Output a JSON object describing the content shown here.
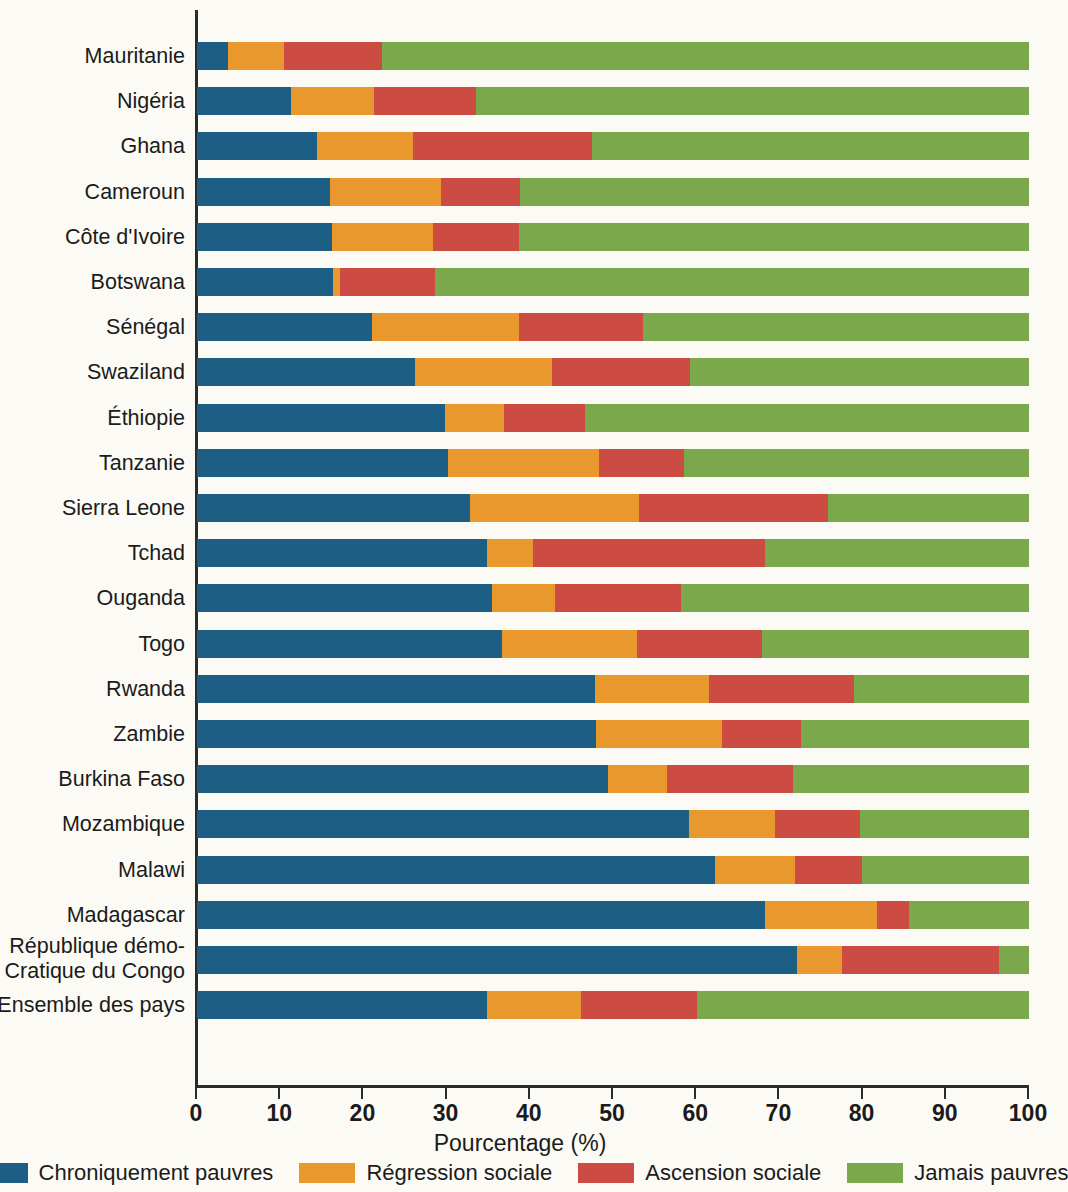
{
  "chart_data": {
    "type": "bar",
    "orientation": "horizontal",
    "stacked": true,
    "stacked_mode": "percent",
    "title": "",
    "xlabel": "Pourcentage (%)",
    "ylabel": "",
    "xlim": [
      0,
      100
    ],
    "xticks": [
      0,
      10,
      20,
      30,
      40,
      50,
      60,
      70,
      80,
      90,
      100
    ],
    "grid": false,
    "legend_position": "bottom",
    "colors": {
      "chroniquement_pauvres": "#1d5f84",
      "regression_sociale": "#e8982c",
      "ascension_sociale": "#cc4b43",
      "jamais_pauvres": "#7aa84a",
      "background": "#fbfaf4",
      "axis": "#2b2b2b"
    },
    "series": [
      {
        "name": "Chroniquement pauvres",
        "color": "#1d5f84",
        "values": [
          3.7,
          11.3,
          14.4,
          16.0,
          16.2,
          16.4,
          21.0,
          26.2,
          29.8,
          30.2,
          32.8,
          34.9,
          35.5,
          36.7,
          47.8,
          48.0,
          49.4,
          59.1,
          62.3,
          68.3,
          72.1,
          34.9
        ]
      },
      {
        "name": "Régression sociale",
        "color": "#e8982c",
        "values": [
          6.8,
          10.0,
          11.6,
          13.3,
          12.2,
          0.8,
          17.7,
          16.5,
          7.1,
          18.1,
          20.3,
          5.5,
          7.5,
          16.2,
          13.7,
          15.1,
          7.1,
          10.4,
          9.6,
          13.4,
          5.4,
          11.3
        ]
      },
      {
        "name": "Ascension sociale",
        "color": "#cc4b43",
        "values": [
          11.7,
          12.2,
          21.5,
          9.5,
          10.3,
          11.4,
          14.9,
          16.6,
          9.7,
          10.2,
          22.8,
          27.9,
          15.2,
          15.0,
          17.5,
          9.5,
          15.1,
          10.2,
          8.0,
          3.9,
          18.9,
          13.9
        ]
      },
      {
        "name": "Jamais pauvres",
        "color": "#7aa84a",
        "values": [
          77.8,
          66.5,
          52.5,
          61.2,
          61.3,
          71.4,
          46.4,
          40.7,
          53.4,
          41.5,
          24.1,
          31.7,
          41.8,
          32.1,
          21.0,
          27.4,
          28.4,
          20.3,
          20.1,
          14.4,
          3.6,
          39.9
        ]
      }
    ],
    "categories": [
      "Mauritanie",
      "Nigéria",
      "Ghana",
      "Cameroun",
      "Côte d'Ivoire",
      "Botswana",
      "Sénégal",
      "Swaziland",
      "Éthiopie",
      "Tanzanie",
      "Sierra Leone",
      "Tchad",
      "Ouganda",
      "Togo",
      "Rwanda",
      "Zambie",
      "Burkina Faso",
      "Mozambique",
      "Malawi",
      "Madagascar",
      "République démo-Cratique du Congo",
      "Ensemble des pays"
    ],
    "category_labels": [
      {
        "lines": [
          "Mauritanie"
        ]
      },
      {
        "lines": [
          "Nigéria"
        ]
      },
      {
        "lines": [
          "Ghana"
        ]
      },
      {
        "lines": [
          "Cameroun"
        ]
      },
      {
        "lines": [
          "Côte d'Ivoire"
        ]
      },
      {
        "lines": [
          "Botswana"
        ]
      },
      {
        "lines": [
          "Sénégal"
        ]
      },
      {
        "lines": [
          "Swaziland"
        ]
      },
      {
        "lines": [
          "Éthiopie"
        ]
      },
      {
        "lines": [
          "Tanzanie"
        ]
      },
      {
        "lines": [
          "Sierra Leone"
        ]
      },
      {
        "lines": [
          "Tchad"
        ]
      },
      {
        "lines": [
          "Ouganda"
        ]
      },
      {
        "lines": [
          "Togo"
        ]
      },
      {
        "lines": [
          "Rwanda"
        ]
      },
      {
        "lines": [
          "Zambie"
        ]
      },
      {
        "lines": [
          "Burkina Faso"
        ]
      },
      {
        "lines": [
          "Mozambique"
        ]
      },
      {
        "lines": [
          "Malawi"
        ]
      },
      {
        "lines": [
          "Madagascar"
        ]
      },
      {
        "lines": [
          "République démo-",
          "Cratique du Congo"
        ]
      },
      {
        "lines": [
          "Ensemble des pays"
        ]
      }
    ]
  },
  "axis": {
    "x_title": "Pourcentage (%)",
    "tick_labels": [
      "0",
      "10",
      "20",
      "30",
      "40",
      "50",
      "60",
      "70",
      "80",
      "90",
      "100"
    ]
  },
  "legend": {
    "items": [
      {
        "label": "Chroniquement pauvres",
        "color": "#1d5f84"
      },
      {
        "label": "Régression sociale",
        "color": "#e8982c"
      },
      {
        "label": "Ascension sociale",
        "color": "#cc4b43"
      },
      {
        "label": "Jamais pauvres",
        "color": "#7aa84a"
      }
    ]
  }
}
